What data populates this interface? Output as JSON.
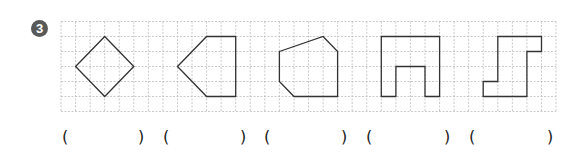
{
  "problem": {
    "number": "3",
    "grid": {
      "left": 61,
      "top": 21.5,
      "cols": 34,
      "rows": 6,
      "cell_w": 14.56,
      "cell_h": 15,
      "line_color": "#bdbdbd",
      "shape_color": "#333333"
    },
    "shapes": [
      {
        "name": "square-rotated",
        "points": [
          [
            1,
            3
          ],
          [
            3,
            1
          ],
          [
            5,
            3
          ],
          [
            3,
            5
          ]
        ]
      },
      {
        "name": "pentagon",
        "points": [
          [
            8,
            3
          ],
          [
            10,
            1
          ],
          [
            12,
            1
          ],
          [
            12,
            5
          ],
          [
            10,
            5
          ]
        ]
      },
      {
        "name": "hexagon",
        "points": [
          [
            15,
            2
          ],
          [
            18,
            1
          ],
          [
            19,
            2
          ],
          [
            19,
            5
          ],
          [
            16,
            5
          ],
          [
            15,
            4
          ]
        ]
      },
      {
        "name": "u-shape",
        "points": [
          [
            22,
            1
          ],
          [
            26,
            1
          ],
          [
            26,
            5
          ],
          [
            25,
            5
          ],
          [
            25,
            3
          ],
          [
            23,
            3
          ],
          [
            23,
            5
          ],
          [
            22,
            5
          ]
        ]
      },
      {
        "name": "s-shape",
        "points": [
          [
            30,
            1
          ],
          [
            33,
            1
          ],
          [
            33,
            2
          ],
          [
            32,
            2
          ],
          [
            32,
            5
          ],
          [
            29,
            5
          ],
          [
            29,
            4
          ],
          [
            30,
            4
          ]
        ]
      }
    ],
    "answer_blanks": [
      {
        "open": "(",
        "close": ")",
        "open_x": 65,
        "close_x": 141,
        "value": ""
      },
      {
        "open": "(",
        "close": ")",
        "open_x": 166,
        "close_x": 243,
        "value": ""
      },
      {
        "open": "(",
        "close": ")",
        "open_x": 267,
        "close_x": 344,
        "value": ""
      },
      {
        "open": "(",
        "close": ")",
        "open_x": 369,
        "close_x": 447,
        "value": ""
      },
      {
        "open": "(",
        "close": ")",
        "open_x": 472,
        "close_x": 550,
        "value": ""
      }
    ]
  }
}
